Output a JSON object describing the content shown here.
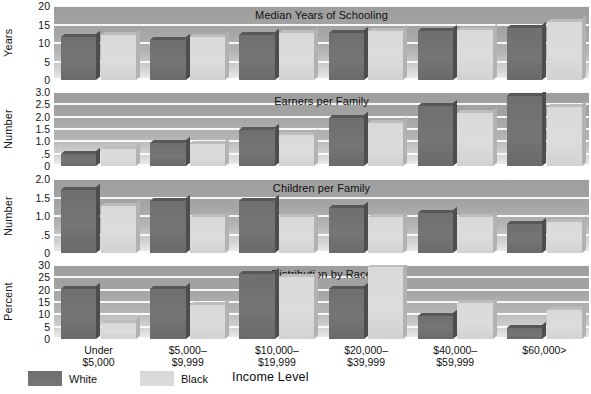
{
  "chart_data": {
    "type": "bar",
    "title": "",
    "xlabel": "Income Level",
    "categories": [
      "Under\n$5,000",
      "$5,000–\n$9,999",
      "$10,000–\n$19,999",
      "$20,000–\n$39,999",
      "$40,000–\n$59,999",
      "$60,000>"
    ],
    "legend": [
      {
        "name": "White",
        "color": "#707070"
      },
      {
        "name": "Black",
        "color": "#d9d9d9"
      }
    ],
    "legend_position": "bottom-left",
    "grid": true,
    "panels": [
      {
        "title": "Median Years of Schooling",
        "ylabel": "Years",
        "ylim": [
          0,
          20
        ],
        "yticks": [
          0,
          5,
          10,
          15,
          20
        ],
        "ytick_labels": [
          "0",
          "5",
          "10",
          "15",
          "20"
        ],
        "series": [
          {
            "name": "White",
            "values": [
              12,
              11,
              12.5,
              13,
              13.5,
              14.5
            ]
          },
          {
            "name": "Black",
            "values": [
              12.5,
              12,
              13,
              13.5,
              14,
              16
            ]
          }
        ]
      },
      {
        "title": "Earners per Family",
        "ylabel": "Number",
        "ylim": [
          0,
          3.0
        ],
        "yticks": [
          0,
          0.5,
          1.0,
          1.5,
          2.0,
          2.5,
          3.0
        ],
        "ytick_labels": [
          "0",
          ".5",
          "1.0",
          "1.5",
          "2.0",
          "2.5",
          "3.0"
        ],
        "series": [
          {
            "name": "White",
            "values": [
              0.5,
              0.95,
              1.5,
              2.0,
              2.5,
              2.9
            ]
          },
          {
            "name": "Black",
            "values": [
              0.7,
              0.9,
              1.3,
              1.8,
              2.2,
              2.45
            ]
          }
        ]
      },
      {
        "title": "Children per Family",
        "ylabel": "Number",
        "ylim": [
          0,
          2.0
        ],
        "yticks": [
          0,
          0.5,
          1.0,
          1.5,
          2.0
        ],
        "ytick_labels": [
          "0",
          ".5",
          "1.0",
          "1.5",
          "2.0"
        ],
        "series": [
          {
            "name": "White",
            "values": [
              1.75,
              1.45,
              1.45,
              1.25,
              1.1,
              0.8
            ]
          },
          {
            "name": "Black",
            "values": [
              1.3,
              1.0,
              1.0,
              1.0,
              1.0,
              0.85
            ]
          }
        ]
      },
      {
        "title": "Distribution by Race",
        "ylabel": "Percent",
        "ylim": [
          0,
          30
        ],
        "yticks": [
          0,
          5,
          10,
          15,
          20,
          25,
          30
        ],
        "ytick_labels": [
          "0",
          "5",
          "10",
          "15",
          "20",
          "25",
          "30"
        ],
        "series": [
          {
            "name": "White",
            "values": [
              21,
              21,
              27,
              21,
              9.5,
              4.5
            ]
          },
          {
            "name": "Black",
            "values": [
              6.5,
              14,
              26,
              30,
              15,
              12
            ]
          }
        ]
      }
    ]
  }
}
